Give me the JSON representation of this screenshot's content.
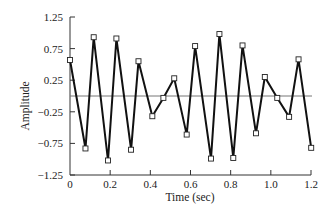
{
  "chart_data": {
    "type": "line",
    "title": "",
    "xlabel": "Time (sec)",
    "ylabel": "Amplitude",
    "xlim": [
      0,
      1.2
    ],
    "ylim": [
      -1.25,
      1.25
    ],
    "xticks": [
      0,
      0.2,
      0.4,
      0.6,
      0.8,
      1.0,
      1.2
    ],
    "xtick_labels": [
      "0",
      "0.2",
      "0.4",
      "0.6",
      "0.8",
      "1.0",
      "1.2"
    ],
    "yticks": [
      1.25,
      0.75,
      0.25,
      -0.25,
      -0.75,
      -1.25
    ],
    "ytick_labels": [
      "1.25",
      "0.75",
      "0.25",
      "−0.25",
      "−0.75",
      "−1.25"
    ],
    "grid": false,
    "zero_line": true,
    "marker": "square-open",
    "legend": null,
    "series": [
      {
        "name": "signal",
        "x": [
          0.0,
          0.077,
          0.118,
          0.189,
          0.231,
          0.304,
          0.341,
          0.41,
          0.465,
          0.519,
          0.581,
          0.623,
          0.702,
          0.744,
          0.813,
          0.859,
          0.926,
          0.97,
          1.032,
          1.091,
          1.138,
          1.201
        ],
        "y": [
          0.57,
          -0.83,
          0.93,
          -1.02,
          0.91,
          -0.85,
          0.55,
          -0.32,
          -0.03,
          0.28,
          -0.61,
          0.79,
          -0.99,
          0.98,
          -0.98,
          0.8,
          -0.59,
          0.3,
          -0.03,
          -0.33,
          0.58,
          -0.82
        ]
      }
    ]
  },
  "colors": {
    "line": "#111111",
    "axis": "#333333",
    "zero_line": "#777777",
    "marker_fill": "#ffffff"
  }
}
